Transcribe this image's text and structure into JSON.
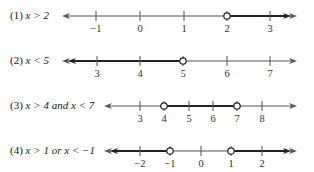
{
  "figure": {
    "colors": {
      "axis": "#555555",
      "solution": "#222222",
      "open_circle_fill": "#ffffff"
    }
  },
  "rows": [
    {
      "label": "(1) x > 2",
      "label_parts": {
        "num": "(1) ",
        "expr": "x > 2"
      },
      "y": 16,
      "x_start": 62,
      "x_end": 297,
      "ticks": [
        {
          "value": "−1",
          "x": 96
        },
        {
          "value": "0",
          "x": 140
        },
        {
          "value": "1",
          "x": 184
        },
        {
          "value": "2",
          "x": 227
        },
        {
          "value": "3",
          "x": 270
        }
      ],
      "open_circles": [
        {
          "value": "2",
          "x": 227
        }
      ],
      "shaded_segments": [
        {
          "from": 227,
          "to": 297,
          "arrow_right": true
        }
      ],
      "left_double_arrow": false,
      "right_double_arrow": true
    },
    {
      "label": "(2) x < 5",
      "label_parts": {
        "num": "(2) ",
        "expr": "x < 5"
      },
      "y": 61,
      "x_start": 62,
      "x_end": 297,
      "ticks": [
        {
          "value": "3",
          "x": 97
        },
        {
          "value": "4",
          "x": 140
        },
        {
          "value": "5",
          "x": 183
        },
        {
          "value": "6",
          "x": 227
        },
        {
          "value": "7",
          "x": 270
        }
      ],
      "open_circles": [
        {
          "value": "5",
          "x": 183
        }
      ],
      "shaded_segments": [
        {
          "from": 62,
          "to": 183,
          "arrow_left": true
        }
      ],
      "left_double_arrow": true,
      "right_double_arrow": false
    },
    {
      "label": "(3) x > 4 and x < 7",
      "label_parts": {
        "num": "(3) ",
        "expr": "x > 4 and x < 7"
      },
      "y": 106,
      "x_start": 104,
      "x_end": 297,
      "ticks": [
        {
          "value": "3",
          "x": 140
        },
        {
          "value": "4",
          "x": 164
        },
        {
          "value": "5",
          "x": 189
        },
        {
          "value": "6",
          "x": 213
        },
        {
          "value": "7",
          "x": 237
        },
        {
          "value": "8",
          "x": 262
        }
      ],
      "open_circles": [
        {
          "value": "4",
          "x": 164
        },
        {
          "value": "7",
          "x": 237
        }
      ],
      "shaded_segments": [
        {
          "from": 164,
          "to": 237
        }
      ],
      "left_double_arrow": false,
      "right_double_arrow": false
    },
    {
      "label": "(4) x > 1 or x < −1",
      "label_parts": {
        "num": "(4) ",
        "expr": "x > 1 or x < −1"
      },
      "y": 151,
      "x_start": 104,
      "x_end": 297,
      "ticks": [
        {
          "value": "−2",
          "x": 140
        },
        {
          "value": "−1",
          "x": 170
        },
        {
          "value": "0",
          "x": 201
        },
        {
          "value": "1",
          "x": 231
        },
        {
          "value": "2",
          "x": 262
        }
      ],
      "open_circles": [
        {
          "value": "−1",
          "x": 170
        },
        {
          "value": "1",
          "x": 231
        }
      ],
      "shaded_segments": [
        {
          "from": 104,
          "to": 170,
          "arrow_left": true
        },
        {
          "from": 231,
          "to": 297,
          "arrow_right": true
        }
      ],
      "left_double_arrow": true,
      "right_double_arrow": true
    }
  ]
}
